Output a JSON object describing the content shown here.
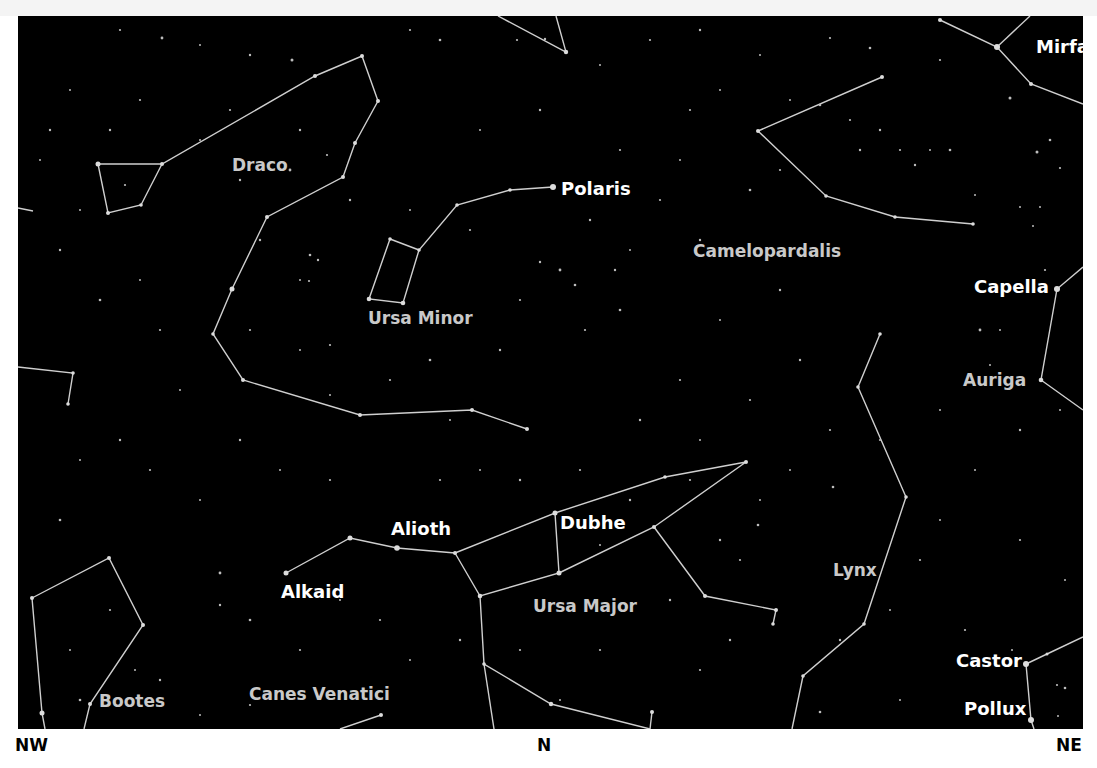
{
  "map": {
    "type": "star-chart",
    "view": "northern-horizon",
    "compass": {
      "left": "NW",
      "center": "N",
      "right": "NE"
    },
    "colors": {
      "sky": "#000000",
      "lines": "#cfcfcf",
      "star_label": "#ffffff",
      "constellation_label": "#c9c9c9"
    },
    "star_labels": {
      "polaris": "Polaris",
      "mirfak": "Mirfak",
      "capella": "Capella",
      "alioth": "Alioth",
      "dubhe": "Dubhe",
      "alkaid": "Alkaid",
      "castor": "Castor",
      "pollux": "Pollux"
    },
    "constellation_labels": {
      "draco": "Draco",
      "ursa_minor": "Ursa Minor",
      "camelopardalis": "Camelopardalis",
      "auriga": "Auriga",
      "ursa_major": "Ursa Major",
      "lynx": "Lynx",
      "bootes": "Bootes",
      "canes_venatici": "Canes Venatici"
    }
  }
}
